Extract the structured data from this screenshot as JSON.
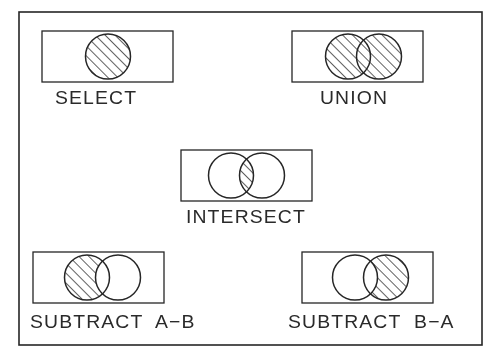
{
  "figure": {
    "background_color": "#ffffff",
    "line_color": "#262626",
    "hatch_color": "#2b2b2b",
    "border": {
      "x": 19,
      "y": 12,
      "width": 463,
      "height": 333,
      "stroke_width": 1.6
    }
  },
  "operations": [
    {
      "id": "select",
      "label": "SELECT",
      "box": {
        "x": 42,
        "y": 31,
        "width": 131,
        "height": 51
      },
      "label_pos": {
        "x": 55,
        "y": 88
      },
      "circles": [
        {
          "cx": 108,
          "cy": 56.5,
          "r": 22.5
        }
      ],
      "fill_mode": "single-filled",
      "description": "One circle entirely hatched"
    },
    {
      "id": "union",
      "label": "UNION",
      "box": {
        "x": 292,
        "y": 31,
        "width": 131,
        "height": 51
      },
      "label_pos": {
        "x": 320,
        "y": 88
      },
      "circles": [
        {
          "cx": 348,
          "cy": 56.5,
          "r": 22.5
        },
        {
          "cx": 379,
          "cy": 56.5,
          "r": 22.5
        }
      ],
      "fill_mode": "union",
      "description": "Both circles hatched including overlap"
    },
    {
      "id": "intersect",
      "label": "INTERSECT",
      "box": {
        "x": 181,
        "y": 150,
        "width": 131,
        "height": 51
      },
      "label_pos": {
        "x": 186,
        "y": 207
      },
      "circles": [
        {
          "cx": 231,
          "cy": 175.5,
          "r": 22.5
        },
        {
          "cx": 262,
          "cy": 175.5,
          "r": 22.5
        }
      ],
      "fill_mode": "intersect",
      "description": "Only the lens-shaped overlap hatched"
    },
    {
      "id": "subtract-a-b",
      "label": "SUBTRACT  A−B",
      "box": {
        "x": 33,
        "y": 252,
        "width": 131,
        "height": 51
      },
      "label_pos": {
        "x": 30,
        "y": 312
      },
      "circles": [
        {
          "cx": 87,
          "cy": 277.5,
          "r": 22.5
        },
        {
          "cx": 118,
          "cy": 277.5,
          "r": 22.5
        }
      ],
      "fill_mode": "difference-ab",
      "description": "Left circle hatched minus the overlap"
    },
    {
      "id": "subtract-b-a",
      "label": "SUBTRACT  B−A",
      "box": {
        "x": 302,
        "y": 252,
        "width": 131,
        "height": 51
      },
      "label_pos": {
        "x": 288,
        "y": 312
      },
      "circles": [
        {
          "cx": 355,
          "cy": 277.5,
          "r": 22.5
        },
        {
          "cx": 386,
          "cy": 277.5,
          "r": 22.5
        }
      ],
      "fill_mode": "difference-ba",
      "description": "Right circle hatched minus the overlap"
    }
  ]
}
